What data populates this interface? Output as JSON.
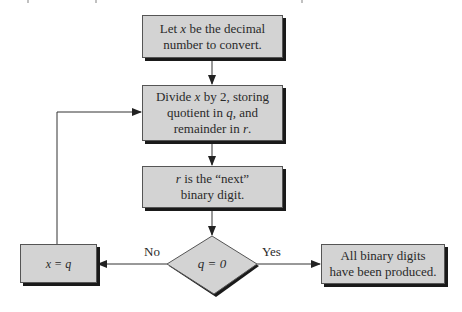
{
  "diagram": {
    "type": "flowchart",
    "nodes": [
      {
        "id": "start",
        "shape": "rectangle",
        "lines": [
          "Let x be the decimal",
          "number to convert."
        ]
      },
      {
        "id": "divide",
        "shape": "rectangle",
        "lines": [
          "Divide x by 2, storing",
          "quotient in q, and",
          "remainder in r."
        ]
      },
      {
        "id": "digit",
        "shape": "rectangle",
        "lines": [
          "r is the “next”",
          "binary digit."
        ]
      },
      {
        "id": "test",
        "shape": "diamond",
        "text": "q = 0"
      },
      {
        "id": "assign",
        "shape": "rectangle",
        "text": "x = q"
      },
      {
        "id": "done",
        "shape": "rectangle",
        "lines": [
          "All binary digits",
          "have been produced."
        ]
      }
    ],
    "edges": [
      {
        "from": "start",
        "to": "divide",
        "label": ""
      },
      {
        "from": "divide",
        "to": "digit",
        "label": ""
      },
      {
        "from": "digit",
        "to": "test",
        "label": ""
      },
      {
        "from": "test",
        "to": "assign",
        "label": "No"
      },
      {
        "from": "test",
        "to": "done",
        "label": "Yes"
      },
      {
        "from": "assign",
        "to": "divide",
        "label": ""
      }
    ],
    "edge_labels": {
      "no": "No",
      "yes": "Yes"
    }
  },
  "text": {
    "start_1a": "Let ",
    "start_1var": "x",
    "start_1b": " be the decimal",
    "start_2": "number to convert.",
    "divide_1a": "Divide ",
    "divide_1var": "x",
    "divide_1b": " by 2, storing",
    "divide_2a": "quotient in ",
    "divide_2var": "q",
    "divide_2b": ", and",
    "divide_3a": "remainder in ",
    "divide_3var": "r",
    "divide_3b": ".",
    "digit_1var": "r",
    "digit_1b": " is the “next”",
    "digit_2": "binary digit.",
    "test": "q = 0",
    "assign": "x = q",
    "done_1": "All binary digits",
    "done_2": "have been produced.",
    "no": "No",
    "yes": "Yes"
  },
  "colors": {
    "box_fill": "#d3d3d3",
    "box_border": "#555555",
    "shadow": "#1a1a1a",
    "line": "#333333"
  }
}
